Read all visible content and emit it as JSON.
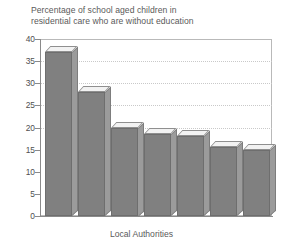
{
  "chart_data": {
    "type": "bar",
    "title": "Percentage of school aged children in\nresidential care who are without education",
    "xlabel": "Local Authorities",
    "ylabel": "",
    "categories": [
      "1",
      "2",
      "3",
      "4",
      "5",
      "6",
      "7"
    ],
    "values": [
      37,
      28,
      20,
      18.5,
      18,
      15.5,
      15
    ],
    "ylim": [
      0,
      40
    ],
    "ytick_labels": [
      "40",
      "35",
      "30",
      "25",
      "20",
      "15",
      "10",
      "5",
      "0"
    ],
    "ytick_values": [
      40,
      35,
      30,
      25,
      20,
      15,
      10,
      5,
      0
    ],
    "gridlines_at": [
      35,
      30,
      25,
      20
    ],
    "grid": true,
    "legend": false,
    "series_color": "#808080",
    "grid_color": "#c9c9c9",
    "axis_color": "#8a8a8a",
    "text_color": "#5a5a5a"
  }
}
